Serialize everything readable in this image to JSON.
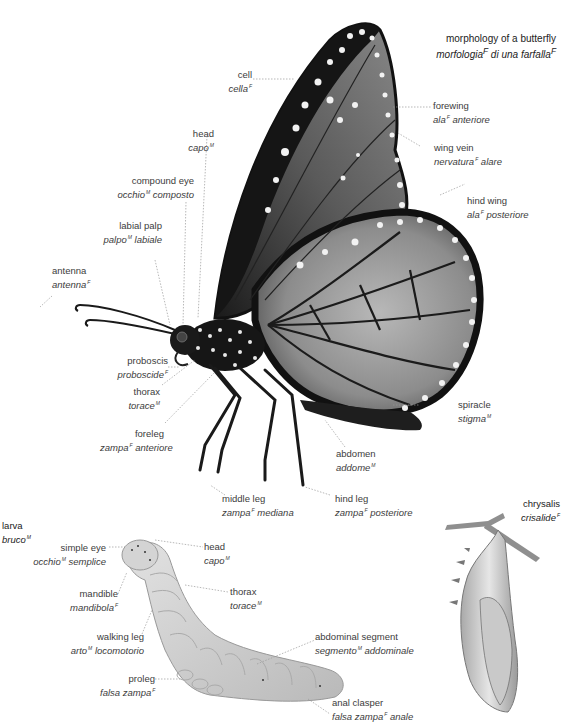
{
  "title": {
    "en": "morphology of a butterfly",
    "it": "morfologia",
    "it_gender": "F",
    "it_rest": " di una farfalla",
    "it_rest_gender": "F"
  },
  "butterfly_labels": [
    {
      "id": "cell",
      "en": "cell",
      "it": "cella",
      "g": "F"
    },
    {
      "id": "forewing",
      "en": "forewing",
      "it": "ala",
      "g": "F",
      "it2": " anteriore"
    },
    {
      "id": "wing-vein",
      "en": "wing vein",
      "it": "nervatura",
      "g": "F",
      "it2": " alare"
    },
    {
      "id": "hind-wing",
      "en": "hind wing",
      "it": "ala",
      "g": "F",
      "it2": " posteriore"
    },
    {
      "id": "head",
      "en": "head",
      "it": "capo",
      "g": "M"
    },
    {
      "id": "compound-eye",
      "en": "compound eye",
      "it": "occhio",
      "g": "M",
      "it2": " composto"
    },
    {
      "id": "labial-palp",
      "en": "labial palp",
      "it": "palpo",
      "g": "M",
      "it2": " labiale"
    },
    {
      "id": "antenna",
      "en": "antenna",
      "it": "antenna",
      "g": "F"
    },
    {
      "id": "proboscis",
      "en": "proboscis",
      "it": "proboscide",
      "g": "F"
    },
    {
      "id": "thorax",
      "en": "thorax",
      "it": "torace",
      "g": "M"
    },
    {
      "id": "foreleg",
      "en": "foreleg",
      "it": "zampa",
      "g": "F",
      "it2": " anteriore"
    },
    {
      "id": "spiracle",
      "en": "spiracle",
      "it": "stigma",
      "g": "M"
    },
    {
      "id": "abdomen",
      "en": "abdomen",
      "it": "addome",
      "g": "M"
    },
    {
      "id": "middle-leg",
      "en": "middle leg",
      "it": "zampa",
      "g": "F",
      "it2": " mediana"
    },
    {
      "id": "hind-leg",
      "en": "hind leg",
      "it": "zampa",
      "g": "F",
      "it2": " posteriore"
    }
  ],
  "larva": {
    "heading_en": "larva",
    "heading_it": "bruco",
    "heading_g": "M",
    "labels": [
      {
        "id": "simple-eye",
        "en": "simple eye",
        "it": "occhio",
        "g": "M",
        "it2": " semplice"
      },
      {
        "id": "head",
        "en": "head",
        "it": "capo",
        "g": "M"
      },
      {
        "id": "mandible",
        "en": "mandible",
        "it": "mandibola",
        "g": "F"
      },
      {
        "id": "thorax",
        "en": "thorax",
        "it": "torace",
        "g": "M"
      },
      {
        "id": "walking-leg",
        "en": "walking leg",
        "it": "arto",
        "g": "M",
        "it2": " locomotorio"
      },
      {
        "id": "abdominal-segment",
        "en": "abdominal segment",
        "it": "segmento",
        "g": "M",
        "it2": " addominale"
      },
      {
        "id": "proleg",
        "en": "proleg",
        "it": "falsa zampa",
        "g": "F"
      },
      {
        "id": "anal-clasper",
        "en": "anal clasper",
        "it": "falsa zampa",
        "g": "F",
        "it2": " anale"
      }
    ]
  },
  "chrysalis": {
    "heading_en": "chrysalis",
    "heading_it": "crisalide",
    "heading_g": "F"
  }
}
